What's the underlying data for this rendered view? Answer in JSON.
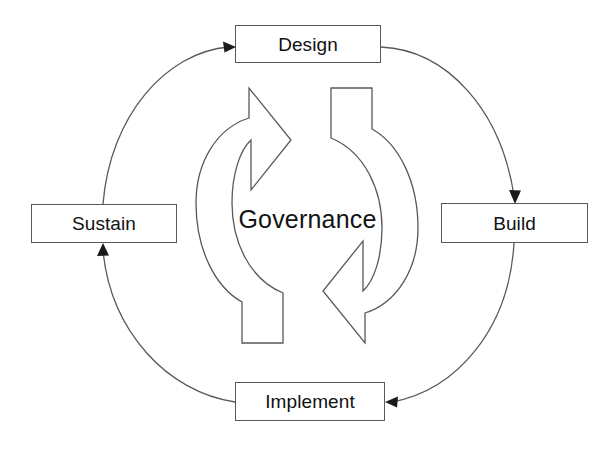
{
  "diagram": {
    "title": "Governance",
    "center_label": "Governance",
    "type": "cycle-diagram",
    "background_color": "#ffffff",
    "line_color": "#555a5e",
    "text_color": "#111111",
    "nodes": [
      {
        "id": "design",
        "label": "Design",
        "position": "top"
      },
      {
        "id": "build",
        "label": "Build",
        "position": "right"
      },
      {
        "id": "implement",
        "label": "Implement",
        "position": "bottom"
      },
      {
        "id": "sustain",
        "label": "Sustain",
        "position": "left"
      }
    ],
    "flow": [
      {
        "from": "design",
        "to": "build",
        "arrowhead": "down"
      },
      {
        "from": "build",
        "to": "implement",
        "arrowhead": "left"
      },
      {
        "from": "implement",
        "to": "sustain",
        "arrowhead": "up"
      },
      {
        "from": "sustain",
        "to": "design",
        "arrowhead": "right"
      }
    ],
    "center_icons": [
      {
        "name": "recycle-arrow-left",
        "direction": "clockwise-upper"
      },
      {
        "name": "recycle-arrow-right",
        "direction": "clockwise-lower"
      }
    ]
  }
}
